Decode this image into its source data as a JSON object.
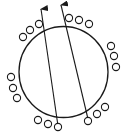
{
  "diagram": {
    "width": 127,
    "height": 138,
    "stroke_color": "#1a1a1a",
    "background": "#ffffff",
    "main_circle": {
      "cx": 63.5,
      "cy": 72,
      "rx": 44.5,
      "ry": 45.5
    },
    "arrows": [
      {
        "x1": 58,
        "y1": 126,
        "x2": 41,
        "y2": 9
      },
      {
        "x1": 88,
        "y1": 119,
        "x2": 61,
        "y2": 5
      }
    ],
    "small_circles": [
      {
        "cx": 23,
        "cy": 37
      },
      {
        "cx": 30,
        "cy": 30
      },
      {
        "cx": 39,
        "cy": 24
      },
      {
        "cx": 69,
        "cy": 18
      },
      {
        "cx": 79,
        "cy": 20
      },
      {
        "cx": 89,
        "cy": 24
      },
      {
        "cx": 111,
        "cy": 46
      },
      {
        "cx": 114,
        "cy": 56
      },
      {
        "cx": 116,
        "cy": 67
      },
      {
        "cx": 11,
        "cy": 77
      },
      {
        "cx": 13,
        "cy": 88
      },
      {
        "cx": 17,
        "cy": 98
      },
      {
        "cx": 38,
        "cy": 120
      },
      {
        "cx": 48,
        "cy": 124
      },
      {
        "cx": 58,
        "cy": 127
      },
      {
        "cx": 88,
        "cy": 121
      },
      {
        "cx": 97,
        "cy": 114
      },
      {
        "cx": 105,
        "cy": 107
      }
    ],
    "small_circle_radius": 3.6
  }
}
